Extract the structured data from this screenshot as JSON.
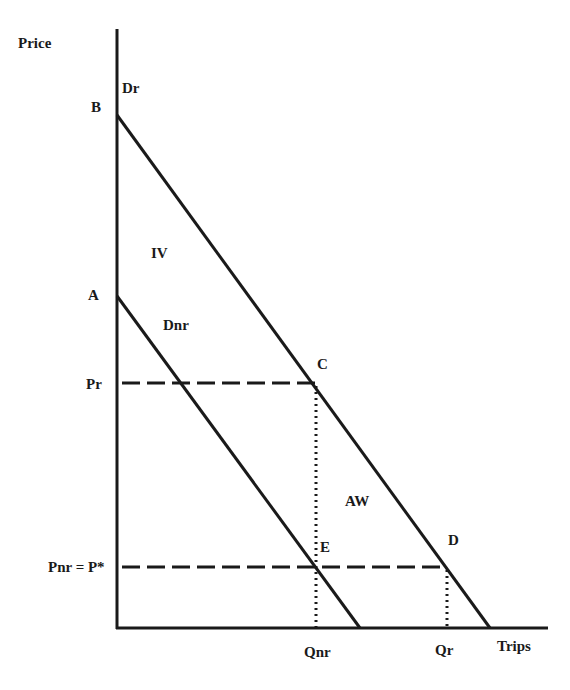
{
  "diagram": {
    "axes": {
      "y_label": "Price",
      "x_label": "Trips"
    },
    "curves": {
      "dr": {
        "label": "Dr",
        "intercept_label": "B"
      },
      "dnr": {
        "label": "Dnr",
        "intercept_label": "A"
      }
    },
    "price_levels": {
      "pr": "Pr",
      "pnr": "Pnr = P*"
    },
    "quantities": {
      "qnr": "Qnr",
      "qr": "Qr"
    },
    "points": {
      "c": "C",
      "d": "D",
      "e": "E"
    },
    "regions": {
      "iv": "IV",
      "aw": "AW"
    },
    "colors": {
      "ink": "#1a1a1a",
      "background": "#ffffff"
    }
  }
}
